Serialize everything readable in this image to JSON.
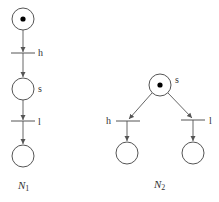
{
  "diagram": {
    "type": "petri-net",
    "nets": [
      {
        "name": "N",
        "subscript": "1",
        "places": [
          {
            "id": "p0",
            "label": "",
            "tokens": 1
          },
          {
            "id": "s",
            "label": "s",
            "tokens": 0
          },
          {
            "id": "p2",
            "label": "",
            "tokens": 0
          }
        ],
        "transitions": [
          {
            "id": "h",
            "label": "h"
          },
          {
            "id": "l",
            "label": "l"
          }
        ],
        "arcs": [
          {
            "from": "p0",
            "to": "h"
          },
          {
            "from": "h",
            "to": "s"
          },
          {
            "from": "s",
            "to": "l"
          },
          {
            "from": "l",
            "to": "p2"
          }
        ]
      },
      {
        "name": "N",
        "subscript": "2",
        "places": [
          {
            "id": "s",
            "label": "s",
            "tokens": 1
          },
          {
            "id": "p1",
            "label": "",
            "tokens": 0
          },
          {
            "id": "p2",
            "label": "",
            "tokens": 0
          }
        ],
        "transitions": [
          {
            "id": "h",
            "label": "h"
          },
          {
            "id": "l",
            "label": "l"
          }
        ],
        "arcs": [
          {
            "from": "s",
            "to": "h"
          },
          {
            "from": "s",
            "to": "l"
          },
          {
            "from": "h",
            "to": "p1"
          },
          {
            "from": "l",
            "to": "p2"
          }
        ]
      }
    ]
  },
  "labels": {
    "n1_h": "h",
    "n1_s": "s",
    "n1_l": "l",
    "n1_name": "N",
    "n1_sub": "1",
    "n2_s": "s",
    "n2_h": "h",
    "n2_l": "l",
    "n2_name": "N",
    "n2_sub": "2"
  },
  "colors": {
    "stroke": "#555555",
    "token": "#000000",
    "background": "#ffffff"
  }
}
